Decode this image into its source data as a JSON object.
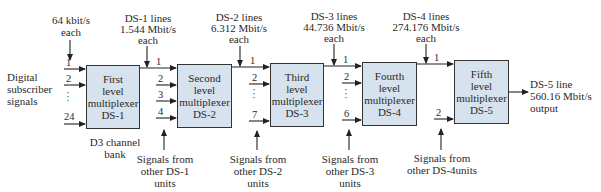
{
  "input_label": {
    "line1": "Digital",
    "line2": "subscriber",
    "line3": "signals"
  },
  "top_labels": [
    {
      "line1": "64 kbit/s",
      "line2": "each"
    },
    {
      "line1": "DS-1 lines",
      "line2": "1.544 Mbit/s",
      "line3": "each"
    },
    {
      "line1": "DS-2 lines",
      "line2": "6.312 Mbit/s",
      "line3": "each"
    },
    {
      "line1": "DS-3 lines",
      "line2": "44.736 Mbit/s",
      "line3": "each"
    },
    {
      "line1": "DS-4 lines",
      "line2": "274.176 Mbit/s",
      "line3": "each"
    }
  ],
  "boxes": [
    {
      "line1": "First",
      "line2": "level",
      "line3": "multiplexer",
      "line4": "DS-1"
    },
    {
      "line1": "Second",
      "line2": "level",
      "line3": "multiplexer",
      "line4": "DS-2"
    },
    {
      "line1": "Third",
      "line2": "level",
      "line3": "multiplexer",
      "line4": "DS-3"
    },
    {
      "line1": "Fourth",
      "line2": "level",
      "line3": "multiplexer",
      "line4": "DS-4"
    },
    {
      "line1": "Fifth",
      "line2": "level",
      "line3": "multiplexer",
      "line4": "DS-5"
    }
  ],
  "input_numbers": {
    "box1": [
      "1",
      "2",
      "24"
    ],
    "box2": [
      "1",
      "2",
      "3",
      "4"
    ],
    "box3": [
      "1",
      "2",
      "7"
    ],
    "box4": [
      "1",
      "2",
      "6"
    ],
    "box5": [
      "1",
      "2"
    ]
  },
  "bottom_labels": [
    {
      "line1": "D3 channel",
      "line2": "bank"
    },
    {
      "line1": "Signals from",
      "line2": "other DS-1",
      "line3": "units"
    },
    {
      "line1": "Signals from",
      "line2": "other DS-2",
      "line3": "units"
    },
    {
      "line1": "Signals from",
      "line2": "other DS-3",
      "line3": "units"
    },
    {
      "line1": "Signals from",
      "line2": "other DS-4units"
    }
  ],
  "output_label": {
    "line1": "DS-5 line",
    "line2": "560.16 Mbit/s",
    "line3": "output"
  },
  "colors": {
    "box_fill": "#d6e2ee",
    "line": "#222222"
  }
}
